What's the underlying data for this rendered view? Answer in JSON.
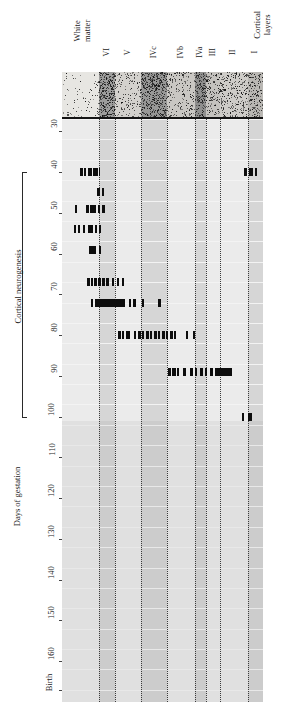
{
  "figure": {
    "title": "",
    "y_axis_label": "Days of gestation",
    "bracket_label": "Cortical neurogenesis",
    "top_left_label_line1": "White",
    "top_left_label_line2": "matter",
    "top_right_label_line1": "Cortical",
    "top_right_label_line2": "layers"
  },
  "layers": [
    {
      "name": "VI",
      "x": 37,
      "w": 16,
      "shaded": true
    },
    {
      "name": "V",
      "x": 53,
      "w": 26,
      "shaded": false
    },
    {
      "name": "IVc",
      "x": 79,
      "w": 26,
      "shaded": true
    },
    {
      "name": "IVb",
      "x": 105,
      "w": 28,
      "shaded": false
    },
    {
      "name": "IVa",
      "x": 133,
      "w": 11,
      "shaded": true
    },
    {
      "name": "III",
      "x": 144,
      "w": 14,
      "shaded": false
    },
    {
      "name": "II",
      "x": 158,
      "w": 28,
      "shaded": false
    },
    {
      "name": "I",
      "x": 186,
      "w": 15,
      "shaded": true
    }
  ],
  "y_ticks": [
    {
      "label": "30",
      "value": 30
    },
    {
      "label": "40",
      "value": 40
    },
    {
      "label": "50",
      "value": 50
    },
    {
      "label": "60",
      "value": 60
    },
    {
      "label": "70",
      "value": 70
    },
    {
      "label": "80",
      "value": 80
    },
    {
      "label": "90",
      "value": 90
    },
    {
      "label": "100",
      "value": 100
    },
    {
      "label": "110",
      "value": 110
    },
    {
      "label": "120",
      "value": 120
    },
    {
      "label": "130",
      "value": 130
    },
    {
      "label": "140",
      "value": 140
    },
    {
      "label": "150",
      "value": 150
    },
    {
      "label": "160",
      "value": 160
    },
    {
      "label": "Birth",
      "value": 167
    }
  ],
  "chart_data": {
    "type": "scatter",
    "xlabel": "Cortical layers",
    "ylabel": "Days of gestation",
    "ylim": [
      27,
      170
    ],
    "grid": true,
    "legend": "none",
    "rows": [
      {
        "day": 40,
        "marks": [
          {
            "x": 18,
            "w": 2.5
          },
          {
            "x": 22,
            "w": 2.0
          },
          {
            "x": 26,
            "w": 3.5
          },
          {
            "x": 31,
            "w": 4.5
          },
          {
            "x": 37,
            "w": 1.2
          },
          {
            "x": 182,
            "w": 3.0
          },
          {
            "x": 187,
            "w": 3.5
          },
          {
            "x": 193,
            "w": 2.0
          }
        ]
      },
      {
        "day": 45,
        "marks": [
          {
            "x": 35,
            "w": 2.5
          },
          {
            "x": 40,
            "w": 2.0
          }
        ]
      },
      {
        "day": 49,
        "marks": [
          {
            "x": 13,
            "w": 1.5
          },
          {
            "x": 24,
            "w": 2.5
          },
          {
            "x": 28,
            "w": 6.0
          },
          {
            "x": 36,
            "w": 2.0
          },
          {
            "x": 40,
            "w": 2.5
          }
        ]
      },
      {
        "day": 54,
        "marks": [
          {
            "x": 12,
            "w": 1.5
          },
          {
            "x": 16,
            "w": 1.5
          },
          {
            "x": 21,
            "w": 1.5
          },
          {
            "x": 26,
            "w": 4.5
          },
          {
            "x": 33,
            "w": 1.5
          },
          {
            "x": 37,
            "w": 1.5
          }
        ]
      },
      {
        "day": 59,
        "marks": [
          {
            "x": 27,
            "w": 6.5
          },
          {
            "x": 37,
            "w": 1.8
          }
        ]
      },
      {
        "day": 67,
        "marks": [
          {
            "x": 25,
            "w": 3.0
          },
          {
            "x": 29,
            "w": 2.0
          },
          {
            "x": 32,
            "w": 2.5
          },
          {
            "x": 36,
            "w": 2.5
          },
          {
            "x": 40,
            "w": 2.5
          },
          {
            "x": 44,
            "w": 2.5
          },
          {
            "x": 50,
            "w": 2.0
          },
          {
            "x": 55,
            "w": 1.8
          },
          {
            "x": 60,
            "w": 1.5
          }
        ]
      },
      {
        "day": 72,
        "marks": [
          {
            "x": 29,
            "w": 2.0
          },
          {
            "x": 33,
            "w": 30.0
          },
          {
            "x": 67,
            "w": 2.0
          },
          {
            "x": 71,
            "w": 2.5
          },
          {
            "x": 80,
            "w": 2.0
          },
          {
            "x": 96,
            "w": 2.5
          }
        ]
      },
      {
        "day": 80,
        "marks": [
          {
            "x": 56,
            "w": 2.5
          },
          {
            "x": 60,
            "w": 2.0
          },
          {
            "x": 64,
            "w": 3.5
          },
          {
            "x": 72,
            "w": 2.0
          },
          {
            "x": 76,
            "w": 2.5
          },
          {
            "x": 80,
            "w": 2.0
          },
          {
            "x": 84,
            "w": 2.5
          },
          {
            "x": 88,
            "w": 2.0
          },
          {
            "x": 92,
            "w": 2.5
          },
          {
            "x": 96,
            "w": 2.0
          },
          {
            "x": 100,
            "w": 2.5
          },
          {
            "x": 104,
            "w": 2.0
          },
          {
            "x": 108,
            "w": 2.5
          },
          {
            "x": 112,
            "w": 2.0
          },
          {
            "x": 124,
            "w": 2.0
          },
          {
            "x": 131,
            "w": 2.0
          }
        ]
      },
      {
        "day": 89,
        "marks": [
          {
            "x": 106,
            "w": 2.5
          },
          {
            "x": 110,
            "w": 3.5
          },
          {
            "x": 115,
            "w": 2.0
          },
          {
            "x": 121,
            "w": 2.5
          },
          {
            "x": 128,
            "w": 2.5
          },
          {
            "x": 133,
            "w": 2.0
          },
          {
            "x": 138,
            "w": 2.5
          },
          {
            "x": 143,
            "w": 2.0
          },
          {
            "x": 148,
            "w": 2.5
          },
          {
            "x": 153,
            "w": 17.0
          }
        ]
      },
      {
        "day": 100,
        "marks": [
          {
            "x": 180,
            "w": 2.0
          },
          {
            "x": 186,
            "w": 3.5
          }
        ]
      }
    ]
  }
}
